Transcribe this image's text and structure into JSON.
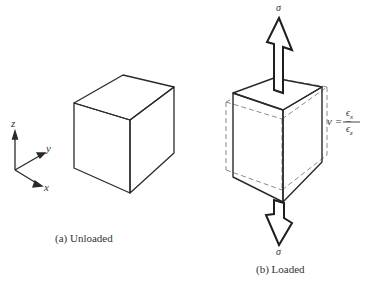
{
  "figure": {
    "panels": [
      {
        "id": "a",
        "caption": "(a) Unloaded",
        "shape": "cube"
      },
      {
        "id": "b",
        "caption": "(b) Loaded",
        "shape": "elongated-cube",
        "original_outline": "dashed"
      }
    ],
    "axes": {
      "z": "z",
      "y": "y",
      "x": "x"
    },
    "load": {
      "top_label": "σ",
      "bottom_label": "σ"
    },
    "equation": {
      "lhs": "ν = −",
      "numerator": "ϵ",
      "numerator_sub": "x",
      "denominator": "ϵ",
      "denominator_sub": "z"
    },
    "colors": {
      "stroke": "#2a2a2a",
      "dashed": "#888888",
      "background": "#ffffff"
    }
  }
}
